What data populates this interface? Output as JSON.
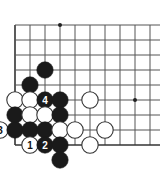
{
  "board": {
    "title": "go-board-diagram",
    "background_color": "#ffffff",
    "line_color": "#555555",
    "edge_color": "#333333",
    "star_point_color": "#222222",
    "black_stone_color": "#1a1a1a",
    "white_stone_color": "#ffffff",
    "white_stone_outline": "#333333",
    "columns": 10,
    "rows": 9,
    "origin_x": 15,
    "origin_y": 25,
    "spacing": 15,
    "stone_radius": 8.2,
    "star_points": [
      {
        "col": 3,
        "row": 0
      },
      {
        "col": 8,
        "row": 5
      }
    ],
    "stones": [
      {
        "col": 2,
        "row": 3,
        "color": "black",
        "label": ""
      },
      {
        "col": 1,
        "row": 4,
        "color": "black",
        "label": ""
      },
      {
        "col": 0,
        "row": 5,
        "color": "white",
        "label": ""
      },
      {
        "col": 1,
        "row": 5,
        "color": "white",
        "label": ""
      },
      {
        "col": 2,
        "row": 5,
        "color": "black",
        "label": "4"
      },
      {
        "col": 3,
        "row": 5,
        "color": "black",
        "label": ""
      },
      {
        "col": 5,
        "row": 5,
        "color": "white",
        "label": ""
      },
      {
        "col": 0,
        "row": 6,
        "color": "black",
        "label": ""
      },
      {
        "col": 1,
        "row": 6,
        "color": "white",
        "label": ""
      },
      {
        "col": 2,
        "row": 6,
        "color": "white",
        "label": ""
      },
      {
        "col": 3,
        "row": 6,
        "color": "black",
        "label": ""
      },
      {
        "col": -1,
        "row": 7,
        "color": "white",
        "label": "3"
      },
      {
        "col": 0,
        "row": 7,
        "color": "black",
        "label": ""
      },
      {
        "col": 1,
        "row": 7,
        "color": "black",
        "label": ""
      },
      {
        "col": 2,
        "row": 7,
        "color": "black",
        "label": ""
      },
      {
        "col": 3,
        "row": 7,
        "color": "white",
        "label": ""
      },
      {
        "col": 4,
        "row": 7,
        "color": "white",
        "label": ""
      },
      {
        "col": 6,
        "row": 7,
        "color": "white",
        "label": ""
      },
      {
        "col": 1,
        "row": 8,
        "color": "white",
        "label": "1"
      },
      {
        "col": 2,
        "row": 8,
        "color": "black",
        "label": "2"
      },
      {
        "col": 3,
        "row": 8,
        "color": "black",
        "label": ""
      },
      {
        "col": 5,
        "row": 8,
        "color": "white",
        "label": ""
      },
      {
        "col": 3,
        "row": 9,
        "color": "black",
        "label": ""
      }
    ]
  },
  "labels": {
    "move_1": "1",
    "move_2": "2",
    "move_3": "3",
    "move_4": "4"
  }
}
